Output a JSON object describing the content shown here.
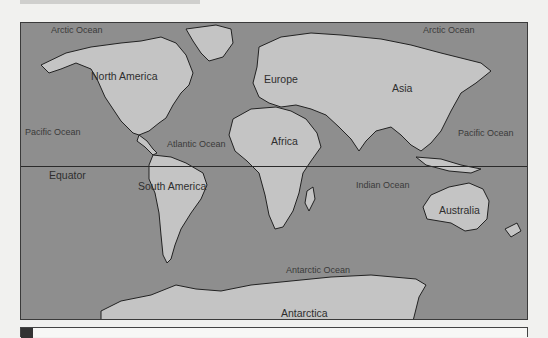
{
  "map": {
    "title": "World map of continents and oceans",
    "colors": {
      "ocean": "#8e8e8e",
      "land": "#c4c4c4",
      "border": "#2a2a2a",
      "background": "#f1f1ef"
    },
    "continents": [
      {
        "name": "North America"
      },
      {
        "name": "South America"
      },
      {
        "name": "Europe"
      },
      {
        "name": "Africa"
      },
      {
        "name": "Asia"
      },
      {
        "name": "Australia"
      },
      {
        "name": "Antarctica"
      }
    ],
    "oceans": [
      {
        "name": "Arctic Ocean",
        "position": "top-left"
      },
      {
        "name": "Arctic Ocean",
        "position": "top-right"
      },
      {
        "name": "Pacific Ocean",
        "position": "left"
      },
      {
        "name": "Pacific Ocean",
        "position": "right"
      },
      {
        "name": "Atlantic Ocean"
      },
      {
        "name": "Indian Ocean"
      },
      {
        "name": "Antarctic Ocean"
      }
    ],
    "lines": {
      "equator": "Equator"
    }
  }
}
